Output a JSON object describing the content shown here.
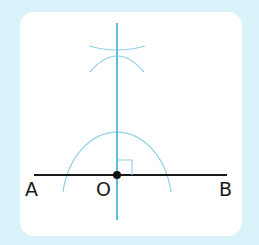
{
  "diagram": {
    "labels": {
      "a": "A",
      "o": "O",
      "b": "B"
    },
    "colors": {
      "background": "#d8f3f9",
      "card": "#ffffff",
      "line": "#1a1a1a",
      "perpendicular": "#5bbfdc",
      "arcs": "#8fd0e4"
    }
  }
}
